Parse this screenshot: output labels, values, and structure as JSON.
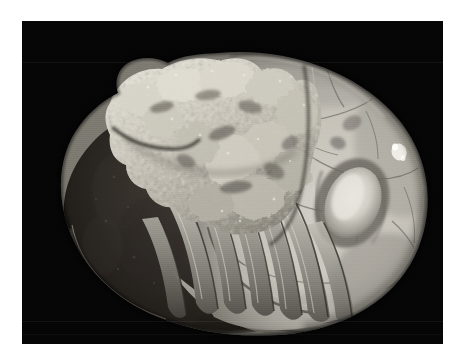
{
  "page": {
    "background_color": "#ffffff",
    "width": 466,
    "height": 363,
    "caption": ""
  },
  "photo": {
    "kind": "photograph",
    "medium": "black-and-white photographic print",
    "subject": "fossil cephalopod specimen (coiled nautiloid / ammonoid) with encrusting growth",
    "background_color": "#050505",
    "border_color": "#ffffff",
    "frame": {
      "x": 22,
      "y": 21,
      "width": 421,
      "height": 323
    },
    "border_widths": {
      "left": 22,
      "top": 21,
      "right": 23,
      "bottom": 19
    },
    "lighting": "strong directional light from upper right; left whorl in deep shadow",
    "alt_text": "A black and white photograph of a large coiled fossil shell on a black background. The right side is a smooth pale dome crossed by suture cracks with an oval depression; the upper left bears a rough whitish encrustation; the lower left is a dark shadowed whorl; the lower middle shows a series of curved ribbed chamber walls.",
    "regions": [
      {
        "name": "right-body-chamber-dome",
        "label": "Smooth pale rounded body chamber",
        "tone": "#b8b6b0",
        "notes": "Large light grey dome occupying the right half, crossed by branching suture cracks."
      },
      {
        "name": "oval-depression",
        "label": "Oval boss / depression with bright highlight",
        "tone": "#dedcd4",
        "notes": "Prominent elongated oval feature lower-right of the dome centre."
      },
      {
        "name": "white-fleck-right",
        "label": "Bright white mineral fleck",
        "tone": "#f2f0ea"
      },
      {
        "name": "white-fleck-upper",
        "label": "Small white mineral fleck near suture junction",
        "tone": "#eeece4"
      },
      {
        "name": "encrustation-mass",
        "label": "Rough whitish encrusting mass",
        "tone": "#cdc9bf",
        "notes": "Knobbly, crusty, irregular pale growth across the upper-left shoulder."
      },
      {
        "name": "dark-whorl",
        "label": "Shadowed inner whorl",
        "tone": "#2a2623",
        "notes": "Deeply shaded rounded left portion of the shell."
      },
      {
        "name": "septal-ribs",
        "label": "Curved septal / chamber ribs",
        "tone": "#8e8b84",
        "notes": "Series of about seven crescent-shaped chamber walls running across the lower middle."
      },
      {
        "name": "lower-right-growth-lines",
        "label": "Concentric growth ridges on lower right flank",
        "tone": "#9a978f"
      }
    ],
    "palette": {
      "paper_white": "#ffffff",
      "plate_black": "#050505",
      "highlight": "#eceae2",
      "midtone": "#9d9a93",
      "shadow": "#262320"
    }
  }
}
